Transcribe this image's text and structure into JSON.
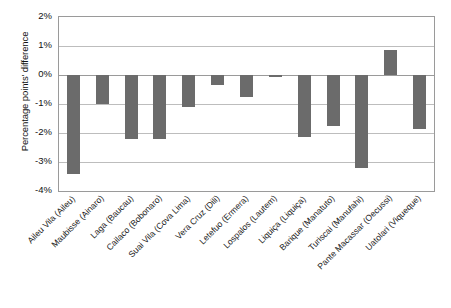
{
  "chart_data": {
    "type": "bar",
    "title": "",
    "subtitle": "",
    "xlabel": "",
    "ylabel": "Percentage points' difference",
    "ylim": [
      -4,
      2
    ],
    "ytick_labels": [
      "2%",
      "1%",
      "0%",
      "-1%",
      "-2%",
      "-3%",
      "-4%"
    ],
    "ytick_values": [
      2,
      1,
      0,
      -1,
      -2,
      -3,
      -4
    ],
    "grid": true,
    "legend": false,
    "bar_color": "#6b6b6b",
    "categories": [
      "Aileu Vila (Aileu)",
      "Maubisse (Ainaro)",
      "Laga (Baucau)",
      "Cailaco (Bobonaro)",
      "Suai Vila (Cova Lima)",
      "Vera Cruz (Dili)",
      "Letefuo (Ermera)",
      "Lospalos (Lautem)",
      "Liquiça (Liquiça)",
      "Barique (Manatuto)",
      "Turiscai (Manufahi)",
      "Pante Macassar (Oecussi)",
      "Uatolari (Viqueque)"
    ],
    "values": [
      -3.4,
      -1.0,
      -2.2,
      -2.2,
      -1.1,
      -0.35,
      -0.75,
      -0.05,
      -2.15,
      -1.75,
      -3.2,
      0.85,
      -1.85
    ]
  }
}
